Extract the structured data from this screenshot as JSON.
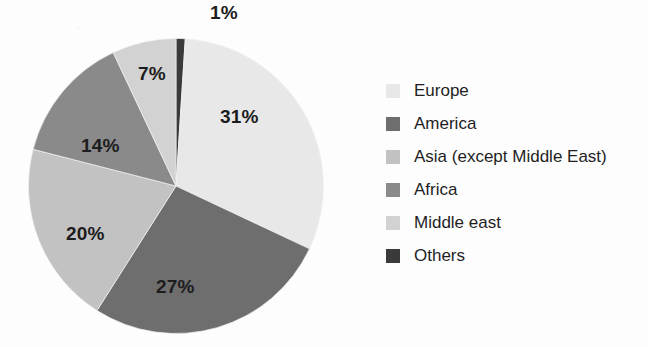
{
  "chart_data": {
    "type": "pie",
    "title": "",
    "subtitle": "",
    "xlabel": "",
    "ylabel": "",
    "grid": false,
    "legend_position": "right",
    "units": "percent",
    "total": 100,
    "start_angle_deg": 0,
    "direction": "clockwise",
    "categories": [
      "Europe",
      "America",
      "Asia (except Middle East)",
      "Africa",
      "Middle east",
      "Others"
    ],
    "values": [
      31,
      27,
      20,
      14,
      7,
      1
    ],
    "data_labels": [
      "31%",
      "27%",
      "20%",
      "14%",
      "7%",
      "1%"
    ],
    "colors": [
      "#e8e8e8",
      "#6e6e6e",
      "#c2c2c2",
      "#8a8a8a",
      "#d2d2d2",
      "#3a3a3a"
    ],
    "slices": [
      {
        "name": "Others",
        "value": 1,
        "label": "1%",
        "color": "#3a3a3a"
      },
      {
        "name": "Europe",
        "value": 31,
        "label": "31%",
        "color": "#e8e8e8"
      },
      {
        "name": "America",
        "value": 27,
        "label": "27%",
        "color": "#6e6e6e"
      },
      {
        "name": "Asia (except Middle East)",
        "value": 20,
        "label": "20%",
        "color": "#c2c2c2"
      },
      {
        "name": "Africa",
        "value": 14,
        "label": "14%",
        "color": "#8a8a8a"
      },
      {
        "name": "Middle east",
        "value": 7,
        "label": "7%",
        "color": "#d2d2d2"
      }
    ]
  },
  "pie": {
    "labels": {
      "others": "1%",
      "europe": "31%",
      "america": "27%",
      "asia": "20%",
      "africa": "14%",
      "middle_east": "7%"
    }
  },
  "legend": {
    "items": [
      {
        "label": "Europe",
        "color": "#e8e8e8"
      },
      {
        "label": "America",
        "color": "#6e6e6e"
      },
      {
        "label": "Asia (except Middle East)",
        "color": "#c2c2c2"
      },
      {
        "label": "Africa",
        "color": "#8a8a8a"
      },
      {
        "label": "Middle east",
        "color": "#d2d2d2"
      },
      {
        "label": "Others",
        "color": "#3a3a3a"
      }
    ]
  }
}
